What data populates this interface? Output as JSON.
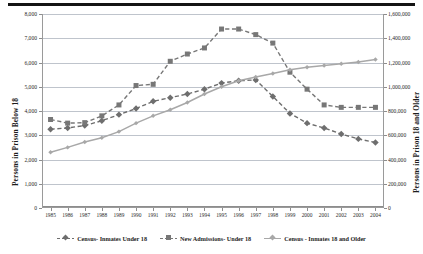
{
  "chart_data": {
    "type": "line",
    "title": "",
    "xlabel": "",
    "ylabel": "Persons in Prison Below 18",
    "y2label": "Persons in Prison 18 and Older",
    "grid": true,
    "legend_position": "bottom",
    "x": [
      1985,
      1986,
      1987,
      1988,
      1989,
      1990,
      1991,
      1992,
      1993,
      1994,
      1995,
      1996,
      1997,
      1998,
      1999,
      2000,
      2001,
      2002,
      2003,
      2004
    ],
    "categories": [
      "1985",
      "1986",
      "1987",
      "1988",
      "1989",
      "1990",
      "1991",
      "1992",
      "1993",
      "1994",
      "1995",
      "1996",
      "1997",
      "1998",
      "1999",
      "2000",
      "2001",
      "2002",
      "2003",
      "2004"
    ],
    "ylim": [
      0,
      8000
    ],
    "yticks": [
      0,
      1000,
      2000,
      3000,
      4000,
      5000,
      6000,
      7000,
      8000
    ],
    "yticklabels": [
      "0",
      "1,000",
      "2,000",
      "3,000",
      "4,000",
      "5,000",
      "6,000",
      "7,000",
      "8,000"
    ],
    "y2lim": [
      0,
      1600000
    ],
    "y2ticks": [
      0,
      200000,
      400000,
      600000,
      800000,
      1000000,
      1200000,
      1400000,
      1600000
    ],
    "y2ticklabels": [
      "0",
      "200,000",
      "400,000",
      "600,000",
      "800,000",
      "1,000,000",
      "1,200,000",
      "1,400,000",
      "1,600,000"
    ],
    "series": [
      {
        "name": "Census- Inmates Under 18",
        "axis": "left",
        "color": "#6e6e6e",
        "linestyle": "dashed",
        "marker": "diamond",
        "values": [
          3250,
          3300,
          3400,
          3600,
          3850,
          4100,
          4400,
          4550,
          4700,
          4900,
          5150,
          5250,
          5280,
          4600,
          3900,
          3500,
          3300,
          3050,
          2850,
          2700
        ]
      },
      {
        "name": "New Admissions- Under 18",
        "axis": "left",
        "color": "#777777",
        "linestyle": "dashed",
        "marker": "square",
        "values": [
          3650,
          3500,
          3520,
          3800,
          4250,
          5050,
          5100,
          6050,
          6350,
          6600,
          7380,
          7380,
          7150,
          6800,
          5600,
          4900,
          4250,
          4150,
          4150,
          4150
        ]
      },
      {
        "name": "Census - Inmates 18 and Older",
        "axis": "right",
        "color": "#a8a8a8",
        "linestyle": "solid",
        "marker": "diamond",
        "values": [
          460000,
          500000,
          545000,
          580000,
          630000,
          700000,
          760000,
          810000,
          870000,
          940000,
          1000000,
          1050000,
          1080000,
          1110000,
          1140000,
          1160000,
          1175000,
          1190000,
          1205000,
          1225000
        ]
      }
    ]
  },
  "legend": {
    "items": [
      {
        "label": "Census- Inmates Under 18"
      },
      {
        "label": "New Admissions- Under 18"
      },
      {
        "label": "Census - Inmates 18 and Older"
      }
    ]
  }
}
